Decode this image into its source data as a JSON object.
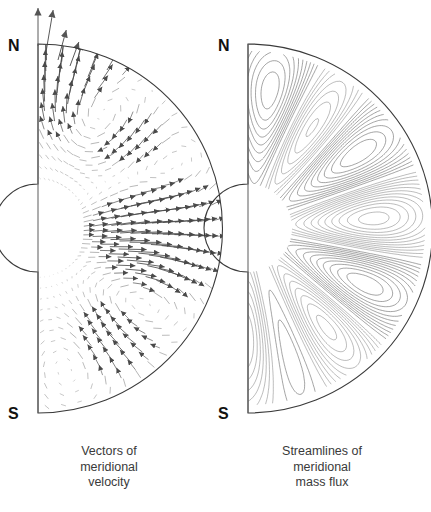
{
  "figure": {
    "background_color": "#ffffff",
    "stroke_color": "#555555",
    "boundary_color": "#3a3a3a",
    "label_color": "#111111",
    "caption_color": "#3a3a3a"
  },
  "panels": [
    {
      "id": "left",
      "kind": "vector-field",
      "north_label": "N",
      "south_label": "S",
      "caption_lines": [
        "Vectors of",
        "meridional",
        "velocity"
      ],
      "geometry": {
        "axis_x": 38,
        "pole_north_y": 44,
        "pole_south_y": 413,
        "equator_y": 228,
        "outer_radius": 184,
        "inner_radius": 44
      }
    },
    {
      "id": "right",
      "kind": "streamlines",
      "north_label": "N",
      "south_label": "S",
      "caption_lines": [
        "Streamlines of",
        "meridional",
        "mass flux"
      ],
      "geometry": {
        "axis_x": 248,
        "pole_north_y": 44,
        "pole_south_y": 413,
        "equator_y": 228,
        "outer_radius": 177,
        "inner_radius": 44
      }
    }
  ],
  "chart_data": {
    "type": "scatter",
    "xlabel": "",
    "ylabel": "",
    "left_panel": {
      "type": "quiver",
      "label": "Vectors of meridional velocity",
      "grid_radial_levels": 13,
      "grid_latitude_levels": 34,
      "note": "Arrow length scales with local meridional speed; several strong polar arrows extend beyond the outer boundary near N.",
      "cells": [
        {
          "name": "north-polar-outflow",
          "center_colatitude_deg": 6,
          "center_radius_fraction": 0.95,
          "sense": "poleward-outward",
          "strength": 1.0
        },
        {
          "name": "north-mid-cell",
          "center_colatitude_deg": 30,
          "center_radius_fraction": 0.62,
          "sense": "clockwise",
          "strength": 0.75
        },
        {
          "name": "north-equatorial-cell",
          "center_colatitude_deg": 62,
          "center_radius_fraction": 0.72,
          "sense": "counterclockwise",
          "strength": 0.55
        },
        {
          "name": "equatorial-jet",
          "center_colatitude_deg": 90,
          "center_radius_fraction": 0.45,
          "sense": "outward",
          "strength": 0.6
        },
        {
          "name": "south-mid-cell",
          "center_colatitude_deg": 128,
          "center_radius_fraction": 0.62,
          "sense": "clockwise",
          "strength": 0.6
        },
        {
          "name": "south-polar-cell",
          "center_colatitude_deg": 160,
          "center_radius_fraction": 0.7,
          "sense": "counterclockwise",
          "strength": 0.5
        }
      ],
      "overflow_arrows": [
        {
          "x": 38,
          "y_tip": 8,
          "angle_deg": 90,
          "length": 38
        },
        {
          "x": 46,
          "y_tip": 10,
          "angle_deg": 72,
          "length": 42
        },
        {
          "x": 58,
          "y_tip": 30,
          "angle_deg": 60,
          "length": 30
        },
        {
          "x": 70,
          "y_tip": 42,
          "angle_deg": 48,
          "length": 24
        }
      ]
    },
    "right_panel": {
      "type": "contour",
      "label": "Streamlines of meridional mass flux",
      "contour_style": {
        "positive": "solid",
        "negative": "dashed"
      },
      "cell_count": 6,
      "cells": [
        {
          "name": "north-polar-cell",
          "center_colatitude_deg": 13,
          "center_radius_fraction": 0.7,
          "sign": "positive",
          "contours": 8,
          "style": "solid"
        },
        {
          "name": "north-subpolar-cell",
          "center_colatitude_deg": 32,
          "center_radius_fraction": 0.62,
          "sign": "negative",
          "contours": 10,
          "style": "dashed"
        },
        {
          "name": "north-main-cell",
          "center_colatitude_deg": 54,
          "center_radius_fraction": 0.66,
          "sign": "positive",
          "contours": 13,
          "style": "solid"
        },
        {
          "name": "equatorial-cell",
          "center_colatitude_deg": 86,
          "center_radius_fraction": 0.62,
          "sign": "negative",
          "contours": 11,
          "style": "dashed"
        },
        {
          "name": "south-main-cell",
          "center_colatitude_deg": 116,
          "center_radius_fraction": 0.64,
          "sign": "positive",
          "contours": 13,
          "style": "solid"
        },
        {
          "name": "south-subpolar-cell",
          "center_colatitude_deg": 143,
          "center_radius_fraction": 0.62,
          "sign": "negative",
          "contours": 9,
          "style": "dashed"
        },
        {
          "name": "south-polar-cell",
          "center_colatitude_deg": 163,
          "center_radius_fraction": 0.6,
          "sign": "positive",
          "contours": 7,
          "style": "solid"
        },
        {
          "name": "south-tail-cell",
          "center_colatitude_deg": 176,
          "center_radius_fraction": 0.55,
          "sign": "negative",
          "contours": 3,
          "style": "dashed"
        }
      ],
      "saddle_points": [
        {
          "colatitude_deg": 70,
          "radius_fraction": 0.52
        },
        {
          "colatitude_deg": 103,
          "radius_fraction": 0.52
        }
      ]
    }
  }
}
